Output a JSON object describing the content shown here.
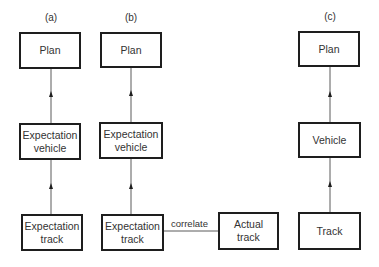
{
  "diagram": {
    "panels": [
      {
        "label": "(a)",
        "nodes": {
          "plan": "Plan",
          "vehicle": "Expectation\nvehicle",
          "track": "Expectation\ntrack"
        }
      },
      {
        "label": "(b)",
        "nodes": {
          "plan": "Plan",
          "vehicle": "Expectation\nvehicle",
          "track": "Expectation\ntrack",
          "actual": "Actual\ntrack"
        },
        "edge_label": "correlate"
      },
      {
        "label": "(c)",
        "nodes": {
          "plan": "Plan",
          "vehicle": "Vehicle",
          "track": "Track"
        }
      }
    ],
    "colors": {
      "stroke": "#1e1e1e",
      "line": "#555555",
      "text": "#333333"
    }
  }
}
